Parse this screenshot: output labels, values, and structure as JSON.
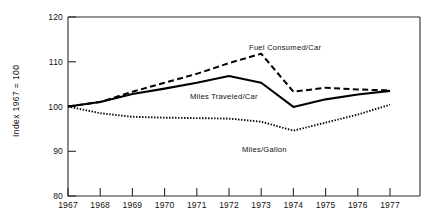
{
  "chart_data": {
    "type": "line",
    "title": "",
    "subtitle": "",
    "xlabel": "",
    "ylabel": "Index 1967 = 100",
    "x": [
      1967,
      1968,
      1969,
      1970,
      1971,
      1972,
      1973,
      1974,
      1975,
      1976,
      1977
    ],
    "xtick_labels": [
      "1967",
      "1968",
      "1969",
      "1970",
      "1971",
      "1972",
      "1973",
      "1974",
      "1975",
      "1976",
      "1977"
    ],
    "ytick_labels": [
      "80",
      "90",
      "100",
      "110",
      "120"
    ],
    "yticks": [
      80,
      90,
      100,
      110,
      120
    ],
    "xlim": [
      1967,
      1978
    ],
    "ylim": [
      80,
      120
    ],
    "grid": false,
    "legend_position": "inline-annotations",
    "series": [
      {
        "name": "Fuel Consumed/Car",
        "style": "dashed",
        "color": "#000000",
        "values": [
          100.0,
          101.0,
          103.3,
          105.3,
          107.3,
          109.7,
          111.8,
          103.3,
          104.2,
          103.8,
          103.6
        ]
      },
      {
        "name": "Miles Traveled/Car",
        "style": "solid",
        "color": "#000000",
        "values": [
          100.0,
          101.0,
          102.8,
          104.0,
          105.3,
          106.8,
          105.3,
          99.9,
          101.6,
          102.7,
          103.5
        ]
      },
      {
        "name": "Miles/Gallon",
        "style": "dotted",
        "color": "#000000",
        "values": [
          100.0,
          98.5,
          97.7,
          97.5,
          97.4,
          97.3,
          96.6,
          94.6,
          96.4,
          98.2,
          100.4
        ]
      }
    ],
    "annotations": [
      {
        "text": "Fuel Consumed/Car",
        "series": "Fuel Consumed/Car",
        "x_px": 249,
        "y_px": 50
      },
      {
        "text": "Miles Traveled/Car",
        "series": "Miles Traveled/Car",
        "x_px": 190,
        "y_px": 99
      },
      {
        "text": "Miles/Gallon",
        "series": "Miles/Gallon",
        "x_px": 242,
        "y_px": 152
      }
    ]
  }
}
